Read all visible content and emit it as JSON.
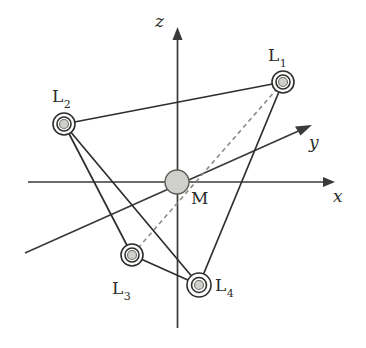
{
  "figure": {
    "background_color": "#ffffff",
    "line_color": "#2e2e2c",
    "dashed_color": "#8c8c88",
    "node_fill_color": "#cfcfcb",
    "width": 366,
    "height": 348
  },
  "axes": [
    {
      "id": "z",
      "label": "z",
      "label_x": 155,
      "label_y": 13,
      "start_x": 177,
      "start_y": 328,
      "end_x": 178,
      "end_y": 30,
      "arrow": "end"
    },
    {
      "id": "x",
      "label": "x",
      "label_x": 333,
      "label_y": 188,
      "start_x": 28,
      "start_y": 182,
      "end_x": 333,
      "end_y": 182,
      "arrow": "end"
    },
    {
      "id": "y",
      "label": "y",
      "label_x": 309,
      "label_y": 134,
      "start_x": 25,
      "start_y": 253,
      "end_x": 310,
      "end_y": 126,
      "arrow": "end"
    }
  ],
  "nodes": [
    {
      "id": "M",
      "label": "M",
      "kind": "mass",
      "x": 177,
      "y": 182,
      "radius": 12,
      "label_x": 191,
      "label_y": 190
    },
    {
      "id": "L1",
      "label": "L",
      "subscript": "1",
      "kind": "satellite",
      "x": 283,
      "y": 82,
      "ring_radius": 11,
      "core_radius": 5,
      "label_x": 268,
      "label_y": 47
    },
    {
      "id": "L2",
      "label": "L",
      "subscript": "2",
      "kind": "satellite",
      "x": 64,
      "y": 124,
      "ring_radius": 11,
      "core_radius": 5,
      "label_x": 52,
      "label_y": 88
    },
    {
      "id": "L3",
      "label": "L",
      "subscript": "3",
      "kind": "satellite",
      "x": 132,
      "y": 255,
      "ring_radius": 11,
      "core_radius": 5,
      "label_x": 112,
      "label_y": 280
    },
    {
      "id": "L4",
      "label": "L",
      "subscript": "4",
      "kind": "satellite",
      "x": 199,
      "y": 285,
      "ring_radius": 12,
      "core_radius": 5,
      "label_x": 215,
      "label_y": 277
    }
  ],
  "edges": [
    {
      "id": "L1-L2",
      "from": "L1",
      "to": "L2",
      "style": "solid"
    },
    {
      "id": "L1-L4",
      "from": "L1",
      "to": "L4",
      "style": "solid"
    },
    {
      "id": "L2-L3",
      "from": "L2",
      "to": "L3",
      "style": "solid"
    },
    {
      "id": "L2-L4",
      "from": "L2",
      "to": "L4",
      "style": "solid"
    },
    {
      "id": "L3-L4",
      "from": "L3",
      "to": "L4",
      "style": "solid"
    },
    {
      "id": "L1-M-L3",
      "from": "L1",
      "to": "L3",
      "style": "dashed"
    }
  ]
}
